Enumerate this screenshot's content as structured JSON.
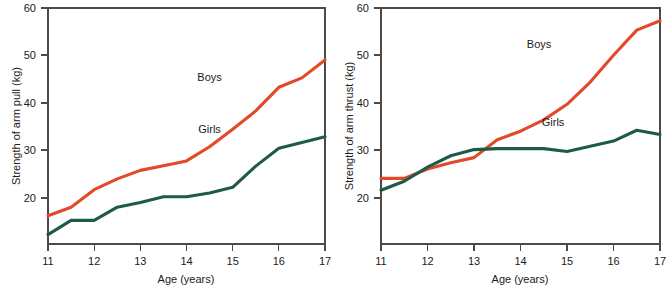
{
  "figure": {
    "cut_off_header": "",
    "background": "#ffffff"
  },
  "colors": {
    "boys": "#E2482A",
    "girls": "#1C5B4A",
    "axis": "#4a4a4a",
    "text": "#1a1a1a"
  },
  "chart_data": [
    {
      "type": "line",
      "title": "",
      "xlabel": "Age (years)",
      "ylabel": "Strength of arm pull (kg)",
      "xlim": [
        11,
        17
      ],
      "ylim": [
        10,
        60
      ],
      "xticks": [
        11,
        12,
        13,
        14,
        15,
        16,
        17
      ],
      "xticklabels": [
        "11",
        "12",
        "13",
        "14",
        "15",
        "16",
        "17"
      ],
      "yticks": [
        20,
        30,
        40,
        50,
        60
      ],
      "yticklabels": [
        "20",
        "30",
        "40",
        "50",
        "60"
      ],
      "grid": false,
      "legend": "inline-annotations",
      "x": [
        11,
        11.5,
        12,
        12.5,
        13,
        13.5,
        14,
        14.5,
        15,
        15.5,
        16,
        16.5,
        17
      ],
      "series": [
        {
          "name": "Boys",
          "label_x": 14.5,
          "label_y": 44.5,
          "values": [
            16.0,
            17.8,
            21.5,
            23.8,
            25.6,
            26.6,
            27.6,
            30.6,
            34.3,
            38.2,
            43.2,
            45.2,
            49.0
          ]
        },
        {
          "name": "Girls",
          "label_x": 14.5,
          "label_y": 33.5,
          "values": [
            12.0,
            15.0,
            15.0,
            17.8,
            18.8,
            20.0,
            20.0,
            20.8,
            22.0,
            26.5,
            30.3,
            31.5,
            32.7
          ]
        }
      ]
    },
    {
      "type": "line",
      "title": "",
      "xlabel": "Age (years)",
      "ylabel": "Strength of arm thrust (kg)",
      "xlim": [
        11,
        17
      ],
      "ylim": [
        10,
        60
      ],
      "xticks": [
        11,
        12,
        13,
        14,
        15,
        16,
        17
      ],
      "xticklabels": [
        "11",
        "12",
        "13",
        "14",
        "15",
        "16",
        "17"
      ],
      "yticks": [
        20,
        30,
        40,
        50,
        60
      ],
      "yticklabels": [
        "20",
        "30",
        "40",
        "50",
        "60"
      ],
      "grid": false,
      "legend": "inline-annotations",
      "x": [
        11,
        11.5,
        12,
        12.5,
        13,
        13.5,
        14,
        14.5,
        15,
        15.5,
        16,
        16.5,
        17
      ],
      "series": [
        {
          "name": "Boys",
          "label_x": 14.4,
          "label_y": 51.5,
          "values": [
            23.9,
            23.9,
            25.9,
            27.2,
            28.3,
            32.1,
            33.9,
            36.3,
            39.6,
            44.3,
            50.0,
            55.3,
            57.3
          ]
        },
        {
          "name": "Girls",
          "label_x": 14.7,
          "label_y": 35.0,
          "values": [
            21.4,
            23.3,
            26.3,
            28.7,
            30.0,
            30.2,
            30.2,
            30.2,
            29.6,
            30.7,
            31.8,
            34.1,
            33.2
          ]
        }
      ]
    }
  ]
}
